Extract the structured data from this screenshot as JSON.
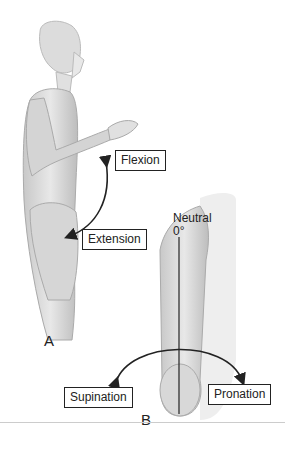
{
  "figure": {
    "panel_a": {
      "letter": "A",
      "labels": {
        "flexion": "Flexion",
        "extension": "Extension"
      }
    },
    "panel_b": {
      "letter": "B",
      "labels": {
        "neutral": "Neutral",
        "degree": "0°",
        "supination": "Supination",
        "pronation": "Pronation"
      }
    }
  },
  "colors": {
    "ink": "#222222",
    "skin_light": "#e6e6e6",
    "skin_mid": "#cfcfcf",
    "skin_dark": "#b5b5b5"
  }
}
